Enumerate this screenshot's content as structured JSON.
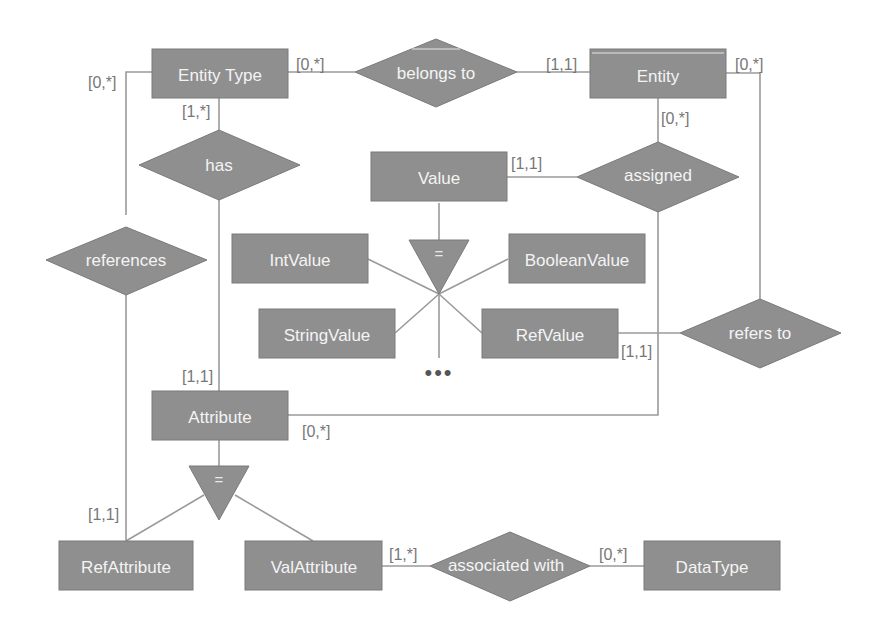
{
  "diagram": {
    "type": "entity-relationship",
    "entities": {
      "entity_type": "Entity Type",
      "entity": "Entity",
      "value": "Value",
      "int_value": "IntValue",
      "boolean_value": "BooleanValue",
      "string_value": "StringValue",
      "ref_value": "RefValue",
      "attribute": "Attribute",
      "ref_attribute": "RefAttribute",
      "val_attribute": "ValAttribute",
      "data_type": "DataType"
    },
    "relationships": {
      "belongs_to": "belongs to",
      "has": "has",
      "assigned": "assigned",
      "references": "references",
      "refers_to": "refers to",
      "associated_with": "associated with"
    },
    "isa_symbol": "=",
    "ellipsis": "•••",
    "cardinalities": {
      "entity_type_belongs_to": "[0,*]",
      "entity_belongs_to": "[1,1]",
      "entity_refers_to": "[0,*]",
      "entity_type_references": "[0,*]",
      "entity_type_has": "[1,*]",
      "entity_assigned": "[0,*]",
      "value_assigned": "[1,1]",
      "ref_value_refers_to": "[1,1]",
      "attribute_has": "[1,1]",
      "attribute_assigned": "[0,*]",
      "ref_attribute_references": "[1,1]",
      "val_attribute_associated_with": "[1,*]",
      "data_type_associated_with": "[0,*]"
    },
    "colors": {
      "shape_fill": "#8f8f8f",
      "shape_text": "#f4f4f4",
      "line": "#9a9a9a",
      "cardinality_text": "#777777",
      "background": "#ffffff"
    }
  }
}
